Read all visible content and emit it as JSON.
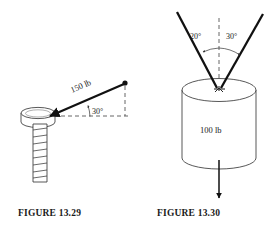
{
  "page": {
    "background_color": "#ffffff",
    "ink_color": "#111111",
    "width": 276,
    "height": 237
  },
  "figures": [
    {
      "id": "figure-13-29",
      "caption": "FIGURE  13.29",
      "subject": "bolt-with-applied-force",
      "labels": {
        "force": "150 lb",
        "angle": "30°"
      },
      "annotations": {
        "force_magnitude": 150,
        "force_units": "lb",
        "angle_degrees": 30,
        "angle_reference": "horizontal",
        "force_direction": "toward bolt head, down-left along 30 degree line",
        "dashed_lines": [
          "horizontal reference",
          "vertical drop from force origin"
        ]
      }
    },
    {
      "id": "figure-13-30",
      "caption": "FIGURE  13.30",
      "subject": "cylinder-suspended-by-two-ropes",
      "labels": {
        "weight": "100 lb",
        "left_angle": "20°",
        "right_angle": "30°"
      },
      "annotations": {
        "weight_magnitude": 100,
        "weight_units": "lb",
        "left_angle_degrees": 20,
        "right_angle_degrees": 30,
        "angle_reference": "vertical dashed centerline",
        "weight_direction": "straight down from cylinder base"
      }
    }
  ]
}
